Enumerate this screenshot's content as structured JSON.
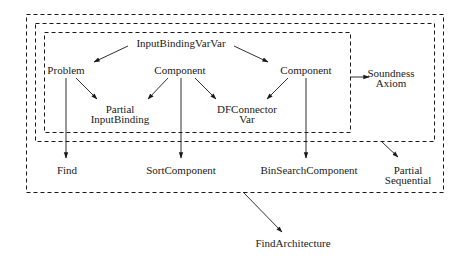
{
  "diagram": {
    "boxes": [
      {
        "name": "outer-box",
        "style": "dashed"
      },
      {
        "name": "middle-box",
        "style": "dashed"
      },
      {
        "name": "inner-box",
        "style": "dashed"
      }
    ],
    "nodes": {
      "input_binding_var_var": "InputBindingVarVar",
      "problem": "Problem",
      "component_left": "Component",
      "component_right": "Component",
      "partial_input_binding": [
        "Partial",
        "InputBinding"
      ],
      "df_connector_var": [
        "DFConnector",
        "Var"
      ],
      "soundness_axiom": [
        "Soundness",
        "Axiom"
      ],
      "find": "Find",
      "sort_component": "SortComponent",
      "bin_search_component": "BinSearchComponent",
      "partial_sequential": [
        "Partial",
        "Sequential"
      ],
      "find_architecture": "FindArchitecture"
    },
    "edges": [
      {
        "from": "InputBindingVarVar",
        "to": "Problem"
      },
      {
        "from": "InputBindingVarVar",
        "to": "Component (right)"
      },
      {
        "from": "Problem",
        "to": "Partial InputBinding"
      },
      {
        "from": "Component (left)",
        "to": "Partial InputBinding"
      },
      {
        "from": "Component (left)",
        "to": "DFConnector Var"
      },
      {
        "from": "Component (right)",
        "to": "DFConnector Var"
      },
      {
        "from": "inner-box",
        "to": "Soundness Axiom"
      },
      {
        "from": "Problem",
        "to": "Find"
      },
      {
        "from": "Component (left)",
        "to": "SortComponent"
      },
      {
        "from": "Component (right)",
        "to": "BinSearchComponent"
      },
      {
        "from": "middle-box",
        "to": "Partial Sequential"
      },
      {
        "from": "outer-box",
        "to": "FindArchitecture"
      }
    ]
  }
}
